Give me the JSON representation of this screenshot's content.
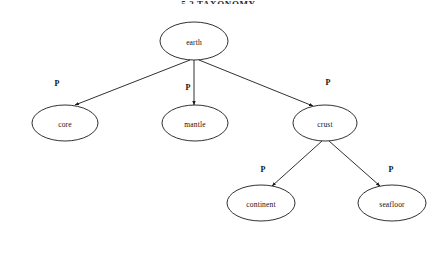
{
  "page": {
    "background_color": "#ffffff",
    "width": 437,
    "height": 263,
    "header_fragment": "5.2   TAXONOMY"
  },
  "diagram": {
    "type": "tree",
    "title": "",
    "edge_style": "straight-line-with-arrowhead",
    "node_shape": "ellipse",
    "stroke_color": "#1a1a1a",
    "fill_color": "#ffffff",
    "nodes": [
      {
        "id": "earth",
        "label": "earth",
        "cx": 194,
        "cy": 41,
        "rx": 34,
        "ry": 19
      },
      {
        "id": "core",
        "label": "core",
        "cx": 65,
        "cy": 123,
        "rx": 33,
        "ry": 18
      },
      {
        "id": "mantle",
        "label": "mantle",
        "cx": 195,
        "cy": 123,
        "rx": 33,
        "ry": 18
      },
      {
        "id": "crust",
        "label": "crust",
        "cx": 325,
        "cy": 123,
        "rx": 32,
        "ry": 18
      },
      {
        "id": "continent",
        "label": "continent",
        "cx": 261,
        "cy": 203,
        "rx": 34,
        "ry": 18
      },
      {
        "id": "seafloor",
        "label": "seafloor",
        "cx": 392,
        "cy": 203,
        "rx": 34,
        "ry": 18
      }
    ],
    "edges": [
      {
        "from": "earth",
        "to": "core",
        "label": "P",
        "x1": 190,
        "y1": 60,
        "x2": 75,
        "y2": 105,
        "lx": 57,
        "ly": 83
      },
      {
        "from": "earth",
        "to": "mantle",
        "label": "P",
        "x1": 194,
        "y1": 60,
        "x2": 194,
        "y2": 105,
        "lx": 188,
        "ly": 87
      },
      {
        "from": "earth",
        "to": "crust",
        "label": "P",
        "x1": 199,
        "y1": 60,
        "x2": 313,
        "y2": 106,
        "lx": 328,
        "ly": 82
      },
      {
        "from": "crust",
        "to": "continent",
        "label": "P",
        "x1": 322,
        "y1": 141,
        "x2": 272,
        "y2": 186,
        "lx": 263,
        "ly": 169
      },
      {
        "from": "crust",
        "to": "seafloor",
        "label": "P",
        "x1": 329,
        "y1": 141,
        "x2": 380,
        "y2": 186,
        "lx": 391,
        "ly": 169
      }
    ]
  }
}
